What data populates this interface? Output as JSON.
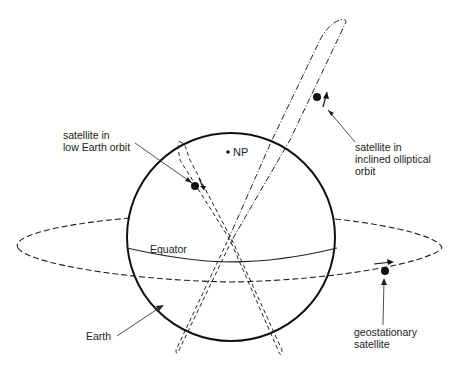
{
  "diagram": {
    "type": "satellite-orbits",
    "labels": {
      "leo": "satellite in\nlow Earth orbit",
      "heo": "satellite in\ninclined olliptical\norbit",
      "np": "NP",
      "equator": "Equator",
      "earth": "Earth",
      "geo": "geostationary\nsatellite"
    },
    "colors": {
      "line": "#111111",
      "text": "#222222",
      "background": "#ffffff"
    }
  }
}
